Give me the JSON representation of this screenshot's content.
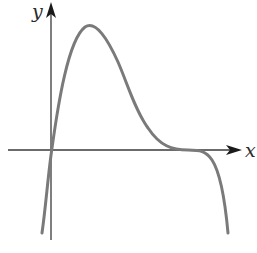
{
  "figure": {
    "axes": {
      "x_label": "x",
      "y_label": "y"
    },
    "colors": {
      "curve": "#7a7a7a",
      "axes": "#3a3a3a",
      "arrowhead": "#1a1a1a",
      "background": "#ffffff"
    },
    "features": {
      "passes_through_origin": true,
      "local_maximum": "single peak above positive x-axis",
      "flat_inflection_on_x_axis": true,
      "end_behavior_left": "down",
      "end_behavior_right": "down"
    }
  }
}
